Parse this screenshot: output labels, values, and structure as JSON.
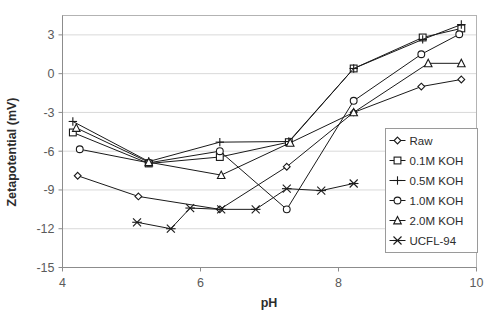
{
  "chart_data": {
    "type": "line",
    "title": "",
    "xlabel": "pH",
    "ylabel": "Zetapotential (mV)",
    "xlim": [
      4,
      10
    ],
    "ylim": [
      -15,
      4.5
    ],
    "xticks": [
      4,
      6,
      8,
      10
    ],
    "yticks": [
      3,
      0,
      -3,
      -6,
      -9,
      -12,
      -15
    ],
    "grid": true,
    "legend_position": "right-middle",
    "series": [
      {
        "name": "Raw",
        "marker": "diamond",
        "x": [
          4.22,
          5.1,
          6.28,
          7.25,
          8.22,
          9.2,
          9.78
        ],
        "y": [
          -7.9,
          -9.5,
          -10.5,
          -7.2,
          -3.0,
          -1.0,
          -0.45
        ]
      },
      {
        "name": "0.1M KOH",
        "marker": "square",
        "x": [
          4.15,
          5.25,
          6.28,
          7.28,
          8.22,
          9.22,
          9.78
        ],
        "y": [
          -4.55,
          -6.95,
          -6.45,
          -5.3,
          0.4,
          2.8,
          3.5
        ]
      },
      {
        "name": "0.5M KOH",
        "marker": "plus",
        "x": [
          4.15,
          5.25,
          6.28,
          7.28,
          8.22,
          9.22,
          9.78
        ],
        "y": [
          -3.7,
          -6.8,
          -5.3,
          -5.25,
          0.4,
          2.65,
          3.8
        ]
      },
      {
        "name": "1.0M KOH",
        "marker": "circle",
        "x": [
          4.25,
          5.25,
          6.28,
          7.25,
          8.22,
          9.2,
          9.75
        ],
        "y": [
          -5.85,
          -6.9,
          -6.0,
          -10.5,
          -2.1,
          1.5,
          3.05
        ]
      },
      {
        "name": "2.0M KOH",
        "marker": "triangle",
        "x": [
          4.2,
          5.25,
          6.3,
          7.3,
          8.22,
          9.3,
          9.78
        ],
        "y": [
          -4.2,
          -6.85,
          -7.85,
          -5.35,
          -3.0,
          0.8,
          0.8
        ]
      },
      {
        "name": "UCFL-94",
        "marker": "cross",
        "x": [
          5.08,
          5.57,
          5.85,
          6.3,
          6.8,
          7.25,
          7.75,
          8.22
        ],
        "y": [
          -11.5,
          -12.0,
          -10.4,
          -10.5,
          -10.5,
          -8.9,
          -9.05,
          -8.5
        ]
      }
    ]
  },
  "legend": {
    "items": [
      {
        "label": "Raw",
        "marker": "diamond"
      },
      {
        "label": "0.1M KOH",
        "marker": "square"
      },
      {
        "label": "0.5M KOH",
        "marker": "plus"
      },
      {
        "label": "1.0M KOH",
        "marker": "circle"
      },
      {
        "label": "2.0M KOH",
        "marker": "triangle"
      },
      {
        "label": "UCFL-94",
        "marker": "cross"
      }
    ]
  },
  "colors": {
    "line": "#1a1a1a",
    "grid": "#d9d9d9",
    "frame": "#b3b3b3",
    "text": "#2c2c2c",
    "tick_text": "#5a5a5a",
    "background": "#ffffff"
  }
}
